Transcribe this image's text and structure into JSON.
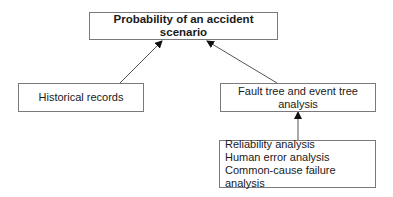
{
  "diagram": {
    "nodes": {
      "top": {
        "label": "Probability of an accident scenario"
      },
      "historical": {
        "label": "Historical records"
      },
      "fault_tree": {
        "line1": "Fault tree and event tree",
        "line2": "analysis"
      },
      "inputs": {
        "lines": [
          "Reliability analysis",
          "Human error analysis",
          "Common-cause failure analysis"
        ]
      }
    },
    "edges": [
      {
        "from": "historical",
        "to": "top"
      },
      {
        "from": "fault_tree",
        "to": "top"
      },
      {
        "from": "inputs",
        "to": "fault_tree"
      }
    ],
    "colors": {
      "line": "#555555",
      "border": "#7a7a7a"
    }
  }
}
